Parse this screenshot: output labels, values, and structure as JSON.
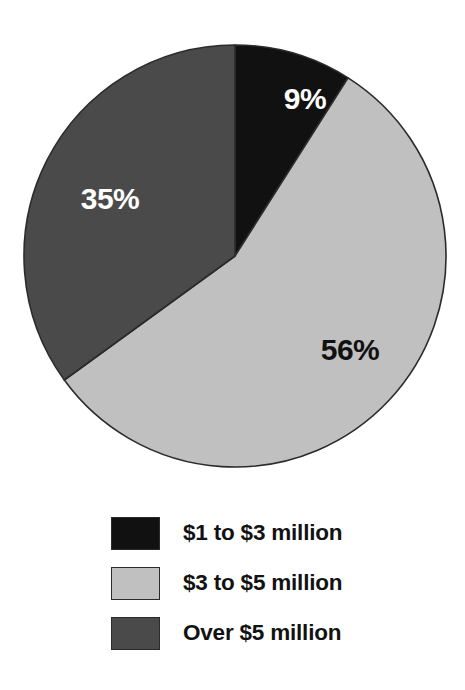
{
  "chart_data": {
    "type": "pie",
    "title": "",
    "subtitle": "",
    "xlabel": "",
    "ylabel": "",
    "grid": false,
    "legend_position": "bottom",
    "start_angle_deg": 0,
    "direction": "clockwise",
    "categories": [
      "$1 to $3 million",
      "$3 to $5 million",
      "Over $5 million"
    ],
    "values": [
      9,
      56,
      35
    ],
    "value_unit": "%",
    "data_labels": [
      "9%",
      "56%",
      "35%"
    ],
    "colors": [
      "#111111",
      "#c0c0c0",
      "#4a4a4a"
    ],
    "label_text_colors": [
      "#ffffff",
      "#111111",
      "#ffffff"
    ],
    "slices": [
      {
        "label": "$1 to $3 million",
        "value": 9,
        "data_label": "9%",
        "color": "#111111",
        "label_color": "#ffffff",
        "start_deg": 0,
        "end_deg": 32.4,
        "label_x": 305,
        "label_y": 101
      },
      {
        "label": "$3 to $5 million",
        "value": 56,
        "data_label": "56%",
        "color": "#c0c0c0",
        "label_color": "#111111",
        "start_deg": 32.4,
        "end_deg": 234.0,
        "label_x": 350,
        "label_y": 352
      },
      {
        "label": "Over $5 million",
        "value": 35,
        "data_label": "35%",
        "color": "#4a4a4a",
        "label_color": "#ffffff",
        "start_deg": 234.0,
        "end_deg": 360.0,
        "label_x": 110,
        "label_y": 201
      }
    ],
    "geometry": {
      "center_x": 235,
      "center_y": 256,
      "radius": 211,
      "outline_color": "#2b2b2b"
    }
  },
  "legend": {
    "items": [
      {
        "label": "$1 to $3 million",
        "color": "#111111"
      },
      {
        "label": "$3 to $5 million",
        "color": "#c0c0c0"
      },
      {
        "label": "Over $5 million",
        "color": "#4a4a4a"
      }
    ]
  },
  "background_color": "#ffffff"
}
